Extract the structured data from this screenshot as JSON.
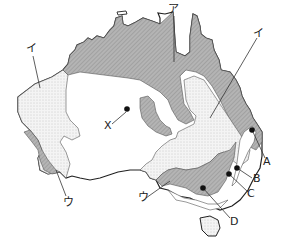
{
  "map": {
    "subject": "Australia",
    "legend_patterns": {
      "dark_hatched": "#a9a9a9",
      "dotted": "#ececec",
      "blank": "#ffffff"
    },
    "zone_labels": {
      "a": "ア",
      "i_west": "イ",
      "i_east": "イ",
      "u_west": "ウ",
      "u_south": "ウ"
    },
    "point_labels": {
      "x": "X",
      "A": "A",
      "B": "B",
      "C": "C",
      "D": "D"
    }
  }
}
